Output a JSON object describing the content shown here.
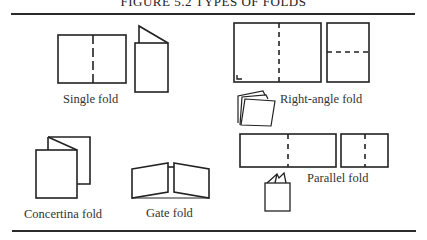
{
  "figure": {
    "title": "FIGURE 5.2  TYPES OF FOLDS",
    "line_color": "#222222",
    "labels": {
      "single": "Single fold",
      "right_angle": "Right-angle fold",
      "concertina": "Concertina fold",
      "gate": "Gate fold",
      "parallel": "Parallel fold"
    }
  }
}
